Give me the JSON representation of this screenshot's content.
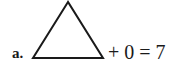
{
  "problem": {
    "label": "a.",
    "shape": "triangle",
    "equation_rest": "+ 0 = 7"
  },
  "colors": {
    "ink": "#1a1a1a",
    "background": "#ffffff"
  }
}
